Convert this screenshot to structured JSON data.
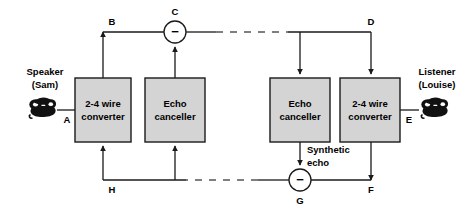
{
  "diagram": {
    "colors": {
      "line": "#1a1a1a",
      "box_fill": "#d4d4d4",
      "box_stroke": "#1a1a1a",
      "circle_fill": "#ffffff",
      "circle_stroke": "#1a1a1a",
      "text": "#000000",
      "phone": "#111111",
      "dash": "#555555"
    },
    "blocks": [
      {
        "id": "left-2to4",
        "line1": "2-4 wire",
        "line2": "converter",
        "x": 75,
        "y": 78,
        "w": 56,
        "h": 64
      },
      {
        "id": "left-echo-canceller",
        "line1": "Echo",
        "line2": "canceller",
        "x": 145,
        "y": 78,
        "w": 60,
        "h": 64
      },
      {
        "id": "right-echo-canceller",
        "line1": "Echo",
        "line2": "canceller",
        "x": 270,
        "y": 78,
        "w": 60,
        "h": 64
      },
      {
        "id": "right-2to4",
        "line1": "2-4 wire",
        "line2": "converter",
        "x": 340,
        "y": 78,
        "w": 60,
        "h": 64
      }
    ],
    "junctions": [
      {
        "id": "C",
        "label": "C",
        "sign": "−",
        "cx": 175,
        "cy": 32,
        "r": 11
      },
      {
        "id": "G",
        "label": "G",
        "sign": "−",
        "cx": 300,
        "cy": 180,
        "r": 11
      }
    ],
    "node_labels": [
      {
        "id": "A",
        "text": "A",
        "x": 67,
        "y": 120
      },
      {
        "id": "B",
        "text": "B",
        "x": 112,
        "y": 22
      },
      {
        "id": "C",
        "text": "C",
        "x": 175,
        "y": 12
      },
      {
        "id": "D",
        "text": "D",
        "x": 371,
        "y": 22
      },
      {
        "id": "E",
        "text": "E",
        "x": 409,
        "y": 120
      },
      {
        "id": "F",
        "text": "F",
        "x": 371,
        "y": 190
      },
      {
        "id": "G",
        "text": "G",
        "x": 300,
        "y": 201
      },
      {
        "id": "H",
        "text": "H",
        "x": 112,
        "y": 190
      }
    ],
    "parties": [
      {
        "id": "speaker",
        "line1": "Speaker",
        "line2": "(Sam)",
        "x": 45,
        "y": 72,
        "icon": "telephone-icon"
      },
      {
        "id": "listener",
        "line1": "Listener",
        "line2": "(Louise)",
        "x": 434,
        "y": 72,
        "icon": "telephone-icon"
      }
    ],
    "annotations": [
      {
        "id": "synthetic-echo",
        "line1": "Synthetic",
        "line2": "echo",
        "x": 307,
        "y": 150
      }
    ]
  }
}
